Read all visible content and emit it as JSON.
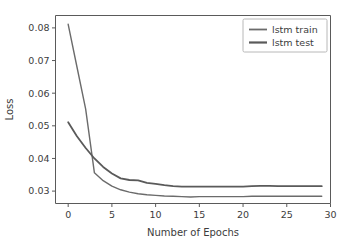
{
  "chart_data": {
    "type": "line",
    "title": "",
    "xlabel": "Number of Epochs",
    "ylabel": "Loss",
    "xlim": [
      -1.45,
      30.0
    ],
    "ylim": [
      0.0262,
      0.0838
    ],
    "xticks": [
      0,
      5,
      10,
      15,
      20,
      25,
      30
    ],
    "xtick_labels": [
      "0",
      "5",
      "10",
      "15",
      "20",
      "25",
      "30"
    ],
    "yticks": [
      0.03,
      0.04,
      0.05,
      0.06,
      0.07,
      0.08
    ],
    "ytick_labels": [
      "0.03",
      "0.04",
      "0.05",
      "0.06",
      "0.07",
      "0.08"
    ],
    "grid": false,
    "legend_position": "upper right",
    "x": [
      0,
      1,
      2,
      3,
      4,
      5,
      6,
      7,
      8,
      9,
      10,
      11,
      12,
      13,
      14,
      15,
      16,
      17,
      18,
      19,
      20,
      21,
      22,
      23,
      24,
      25,
      26,
      27,
      28,
      29
    ],
    "series": [
      {
        "name": "lstm train",
        "color": "#6b6b6b",
        "linewidth": 1.4,
        "values": [
          0.0811,
          0.0681,
          0.0551,
          0.0356,
          0.0332,
          0.0315,
          0.0304,
          0.0297,
          0.0292,
          0.0289,
          0.0287,
          0.0285,
          0.0284,
          0.0283,
          0.0282,
          0.0283,
          0.0283,
          0.0283,
          0.0283,
          0.0283,
          0.0283,
          0.0284,
          0.0284,
          0.0284,
          0.0284,
          0.0284,
          0.0284,
          0.0284,
          0.0284,
          0.0284
        ]
      },
      {
        "name": "lstm test",
        "color": "#5a5a5a",
        "linewidth": 1.8,
        "values": [
          0.0511,
          0.0468,
          0.0432,
          0.04,
          0.0374,
          0.0354,
          0.0339,
          0.0334,
          0.0333,
          0.0325,
          0.0322,
          0.0318,
          0.0315,
          0.0314,
          0.0314,
          0.0314,
          0.0314,
          0.0314,
          0.0314,
          0.0314,
          0.0314,
          0.0315,
          0.0316,
          0.0316,
          0.0315,
          0.0315,
          0.0315,
          0.0315,
          0.0315,
          0.0315
        ]
      }
    ],
    "annotations": []
  }
}
